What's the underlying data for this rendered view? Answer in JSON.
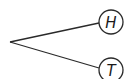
{
  "diagram": {
    "type": "probability-tree",
    "root": {
      "x": 10,
      "y": 42
    },
    "line_color": "#2a2a2a",
    "circle_stroke": "#2a2a2a",
    "circle_fill": "#ffffff",
    "nodes": [
      {
        "label": "H",
        "cx": 111,
        "cy": 22,
        "r": 12
      },
      {
        "label": "T",
        "cx": 111,
        "cy": 70,
        "r": 12
      }
    ]
  }
}
